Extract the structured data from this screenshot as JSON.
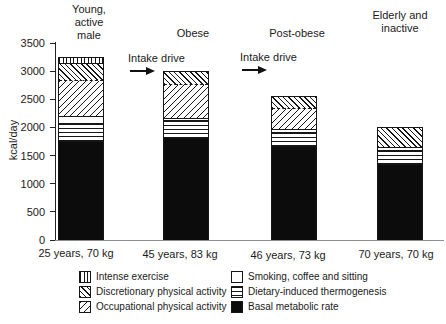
{
  "chart_data": {
    "type": "bar",
    "stacked": true,
    "title": "",
    "ylabel": "kcal/day",
    "ylim": [
      0,
      3500
    ],
    "yticks": [
      0,
      500,
      1000,
      1500,
      2000,
      2500,
      3000,
      3500
    ],
    "grid": false,
    "legend_position": "bottom",
    "legend": [
      {
        "key": "intense",
        "label": "Intense exercise",
        "pattern": "vertical-lines"
      },
      {
        "key": "discretionary",
        "label": "Discretionary physical activity",
        "pattern": "diagonal-hatch-down"
      },
      {
        "key": "occupational",
        "label": "Occupational physical activity",
        "pattern": "diagonal-hatch-up"
      },
      {
        "key": "smoking",
        "label": "Smoking, coffee and sitting",
        "pattern": "plain-white"
      },
      {
        "key": "thermogenesis",
        "label": "Dietary-induced thermogenesis",
        "pattern": "horizontal-lines"
      },
      {
        "key": "bmr",
        "label": "Basal metabolic rate",
        "pattern": "solid-black"
      }
    ],
    "bars": [
      {
        "header": "Young,\nactive\nmale",
        "xlabel": "25 years, 70 kg",
        "total": 3250,
        "segments": [
          {
            "key": "bmr",
            "from": 0,
            "to": 1750
          },
          {
            "key": "thermogenesis",
            "from": 1750,
            "to": 2075
          },
          {
            "key": "smoking",
            "from": 2075,
            "to": 2200
          },
          {
            "key": "occupational",
            "from": 2200,
            "to": 2850,
            "boundary_above": "dashed"
          },
          {
            "key": "discretionary",
            "from": 2850,
            "to": 3150
          },
          {
            "key": "intense",
            "from": 3150,
            "to": 3250
          }
        ]
      },
      {
        "header": "Obese",
        "xlabel": "45 years, 83 kg",
        "total": 3000,
        "segments": [
          {
            "key": "bmr",
            "from": 0,
            "to": 1825
          },
          {
            "key": "thermogenesis",
            "from": 1825,
            "to": 2125
          },
          {
            "key": "smoking",
            "from": 2125,
            "to": 2175
          },
          {
            "key": "occupational",
            "from": 2175,
            "to": 2775,
            "boundary_above": "dashed"
          },
          {
            "key": "discretionary",
            "from": 2775,
            "to": 3000
          }
        ]
      },
      {
        "header": "Post-obese",
        "xlabel": "46 years, 73 kg",
        "total": 2550,
        "segments": [
          {
            "key": "bmr",
            "from": 0,
            "to": 1675
          },
          {
            "key": "thermogenesis",
            "from": 1675,
            "to": 1925
          },
          {
            "key": "smoking",
            "from": 1925,
            "to": 1975
          },
          {
            "key": "occupational",
            "from": 1975,
            "to": 2350,
            "boundary_above": "dashed"
          },
          {
            "key": "discretionary",
            "from": 2350,
            "to": 2550
          }
        ]
      },
      {
        "header": "Elderly and\ninactive",
        "xlabel": "70 years, 70 kg",
        "total": 2000,
        "segments": [
          {
            "key": "bmr",
            "from": 0,
            "to": 1350
          },
          {
            "key": "thermogenesis",
            "from": 1350,
            "to": 1600
          },
          {
            "key": "smoking",
            "from": 1600,
            "to": 1650
          },
          {
            "key": "discretionary",
            "from": 1650,
            "to": 2000
          }
        ]
      }
    ],
    "annotations": [
      {
        "text": "Intake drive",
        "points_to_bar": "Obese"
      },
      {
        "text": "Intake drive",
        "points_to_bar": "Post-obese"
      }
    ]
  }
}
